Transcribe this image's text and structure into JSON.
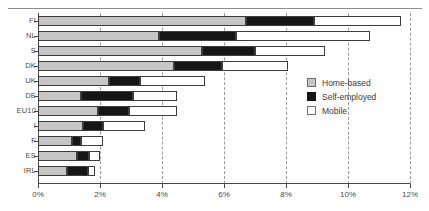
{
  "chart_data": {
    "type": "bar",
    "orientation": "horizontal",
    "stacked": true,
    "title": "",
    "xlabel": "",
    "ylabel": "",
    "xlim": [
      0,
      12
    ],
    "xunit": "%",
    "xticks": [
      "0%",
      "2%",
      "4%",
      "6%",
      "8%",
      "10%",
      "12%"
    ],
    "xtickvalues": [
      0,
      2,
      4,
      6,
      8,
      10,
      12
    ],
    "grid": "vertical-dashed",
    "legend_position": "inside-right",
    "categories": [
      "FI",
      "NL",
      "S",
      "DK",
      "UK",
      "DE",
      "EU10",
      "I",
      "F",
      "ES",
      "IRL"
    ],
    "series": [
      {
        "name": "Home-based",
        "color": "#c6c6c6",
        "values": [
          6.7,
          3.9,
          5.3,
          4.4,
          2.3,
          1.4,
          1.95,
          1.45,
          1.1,
          1.25,
          0.95
        ]
      },
      {
        "name": "Self-employed",
        "color": "#161616",
        "values": [
          2.2,
          2.5,
          1.7,
          1.55,
          1.0,
          1.65,
          1.0,
          0.65,
          0.3,
          0.4,
          0.65
        ]
      },
      {
        "name": "Mobile",
        "color": "#ffffff",
        "values": [
          2.8,
          4.3,
          2.25,
          2.1,
          2.1,
          1.45,
          1.55,
          1.35,
          0.7,
          0.35,
          0.25
        ]
      }
    ],
    "totals": [
      11.7,
      10.7,
      9.25,
      8.05,
      5.4,
      4.5,
      4.5,
      3.45,
      2.1,
      2.0,
      1.85
    ]
  },
  "legend": {
    "items": [
      {
        "label": "Home-based",
        "swatch": "home"
      },
      {
        "label": "Self-employed",
        "swatch": "self"
      },
      {
        "label": "Mobile",
        "swatch": "mobile"
      }
    ]
  }
}
